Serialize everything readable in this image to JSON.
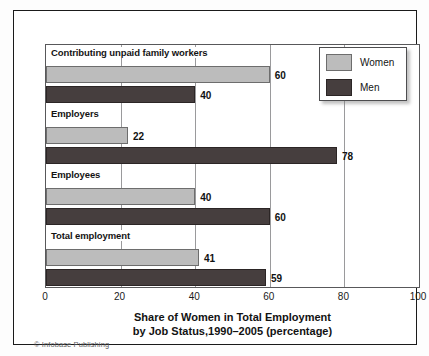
{
  "chart_data": {
    "type": "bar",
    "orientation": "horizontal",
    "title": "Share of Women in Total Employment by Job Status,1990–2005 (percentage)",
    "title_lines": [
      "Share of Women in Total Employment",
      "by Job Status,1990–2005 (percentage)"
    ],
    "xlabel": "",
    "ylabel": "",
    "xlim": [
      0,
      100
    ],
    "xticks": [
      "0",
      "20",
      "40",
      "60",
      "80",
      "100"
    ],
    "xtick_values": [
      0,
      20,
      40,
      60,
      80,
      100
    ],
    "grid": "vertical gridlines at 20, 40, 60, 80",
    "legend_position": "top-right",
    "categories": [
      "Contributing unpaid family workers",
      "Employers",
      "Employees",
      "Total employment"
    ],
    "series": [
      {
        "name": "Women",
        "color": "#bcbcbc",
        "values": [
          60,
          22,
          40,
          41
        ]
      },
      {
        "name": "Men",
        "color": "#463e3e",
        "values": [
          40,
          78,
          60,
          59
        ]
      }
    ],
    "data_labels": [
      {
        "category": "Contributing unpaid family workers",
        "women": "60",
        "men": "40"
      },
      {
        "category": "Employers",
        "women": "22",
        "men": "78"
      },
      {
        "category": "Employees",
        "women": "40",
        "men": "60"
      },
      {
        "category": "Total employment",
        "women": "41",
        "men": "59"
      }
    ],
    "credit": "© Infobase Publishing"
  },
  "legend": {
    "entries": [
      {
        "label": "Women",
        "color": "#bcbcbc"
      },
      {
        "label": "Men",
        "color": "#463e3e"
      }
    ]
  },
  "groups": [
    {
      "label": "Contributing unpaid family workers",
      "women": 60,
      "men": 40,
      "women_label": "60",
      "men_label": "40"
    },
    {
      "label": "Employers",
      "women": 22,
      "men": 78,
      "women_label": "22",
      "men_label": "78"
    },
    {
      "label": "Employees",
      "women": 40,
      "men": 60,
      "women_label": "40",
      "men_label": "60"
    },
    {
      "label": "Total employment",
      "women": 41,
      "men": 59,
      "women_label": "41",
      "men_label": "59"
    }
  ],
  "axis": {
    "ticks": [
      "0",
      "20",
      "40",
      "60",
      "80",
      "100"
    ]
  },
  "title": {
    "line1": "Share of Women in Total Employment",
    "line2": "by Job Status,1990–2005 (percentage)"
  },
  "credit": {
    "text": "© Infobase Publishing"
  }
}
